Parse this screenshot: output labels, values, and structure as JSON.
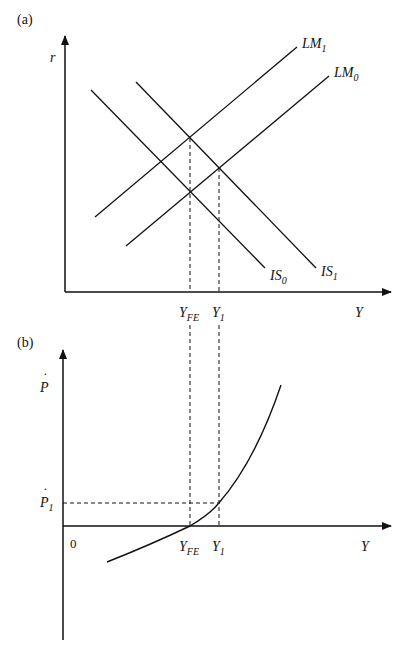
{
  "panel_a": {
    "label": "(a)",
    "y_axis_label": "r",
    "x_axis_label": "Y",
    "curves": {
      "lm1": {
        "base": "LM",
        "sub": "1"
      },
      "lm0": {
        "base": "LM",
        "sub": "0"
      },
      "is0": {
        "base": "IS",
        "sub": "0"
      },
      "is1": {
        "base": "IS",
        "sub": "1"
      }
    },
    "x_ticks": {
      "yfe": {
        "base": "Y",
        "sub": "FE"
      },
      "y1": {
        "base": "Y",
        "sub": "1"
      }
    }
  },
  "panel_b": {
    "label": "(b)",
    "y_axis_label": "P",
    "y_axis_dot": "˙",
    "x_axis_label": "Y",
    "origin_label": "0",
    "y_ticks": {
      "p1": {
        "base": "P",
        "dot": "˙",
        "sub": "1"
      }
    },
    "x_ticks": {
      "yfe": {
        "base": "Y",
        "sub": "FE"
      },
      "y1": {
        "base": "Y",
        "sub": "1"
      }
    }
  },
  "colors": {
    "ink": "#111111",
    "background": "#ffffff"
  }
}
